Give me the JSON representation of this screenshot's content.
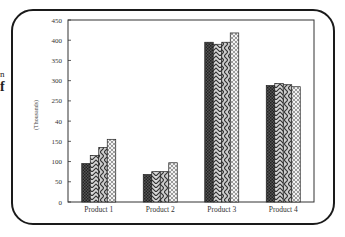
{
  "page_fragments": {
    "line1": "n",
    "line2": "f"
  },
  "chart_data": {
    "type": "bar",
    "title": "",
    "xlabel": "",
    "ylabel": "(Thousands)",
    "categories": [
      "Product 1",
      "Product 2",
      "Product 3",
      "Product 4"
    ],
    "series": [
      {
        "name": "Series 1",
        "pattern": "dense-crosshatch",
        "values": [
          95,
          68,
          395,
          288
        ]
      },
      {
        "name": "Series 2",
        "pattern": "chevron",
        "values": [
          115,
          75,
          390,
          293
        ]
      },
      {
        "name": "Series 3",
        "pattern": "diagonal-chevron",
        "values": [
          135,
          75,
          395,
          290
        ]
      },
      {
        "name": "Series 4",
        "pattern": "light-checker",
        "values": [
          155,
          97,
          418,
          285
        ]
      }
    ],
    "yticks": [
      0,
      50,
      100,
      150,
      200,
      250,
      300,
      350,
      400,
      450
    ],
    "ytick_labels": [
      "0",
      "50",
      "100",
      "150",
      "40",
      "250",
      "300",
      "350",
      "400",
      "450"
    ],
    "ylim": [
      0,
      450
    ],
    "grid": false,
    "legend": "none"
  },
  "colors": {
    "frame": "#1a1a1a",
    "axis": "#333333",
    "bar_stroke": "#222222"
  }
}
